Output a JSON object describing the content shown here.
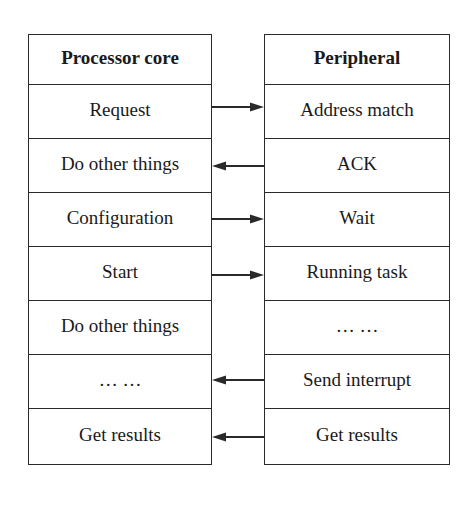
{
  "diagram": {
    "left_column": {
      "title": "Processor core",
      "rows": [
        "Request",
        "Do other things",
        "Configuration",
        "Start",
        "Do other things",
        "… …",
        "Get results"
      ]
    },
    "right_column": {
      "title": "Peripheral",
      "rows": [
        "Address match",
        "ACK",
        "Wait",
        "Running task",
        "… …",
        "Send interrupt",
        "Get results"
      ]
    },
    "arrows": [
      {
        "row": 0,
        "direction": "right",
        "from": "Request",
        "to": "Address match"
      },
      {
        "row": 1,
        "direction": "left",
        "from": "ACK",
        "to": "Do other things"
      },
      {
        "row": 2,
        "direction": "right",
        "from": "Configuration",
        "to": "Wait"
      },
      {
        "row": 3,
        "direction": "right",
        "from": "Start",
        "to": "Running task"
      },
      {
        "row": 5,
        "direction": "left",
        "from": "Send interrupt",
        "to": "… …"
      },
      {
        "row": 6,
        "direction": "left",
        "from": "Get results",
        "to": "Get results"
      }
    ],
    "colors": {
      "line": "#2a2a2a",
      "text": "#1a1a1a",
      "background": "#ffffff"
    }
  }
}
